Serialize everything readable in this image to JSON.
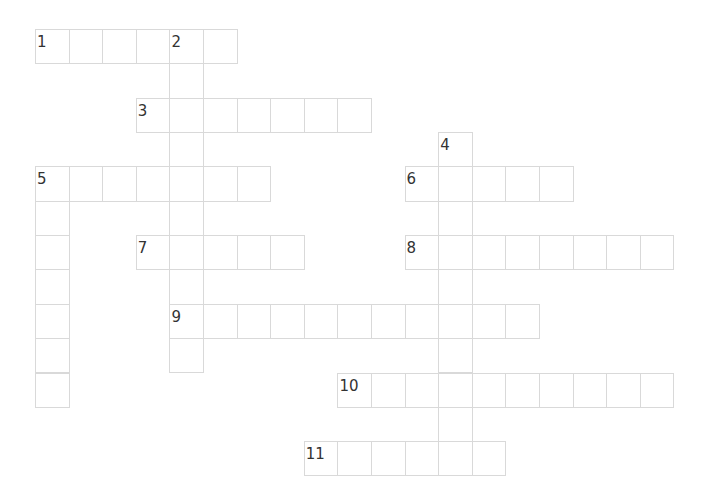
{
  "puzzle": {
    "grid": {
      "origin_x": 35,
      "origin_y": 29,
      "cell_w": 33.6,
      "cell_h": 34.35,
      "line_color": "#d9d9d9"
    },
    "words": [
      {
        "number": "1",
        "direction": "across",
        "row": 0,
        "col": 0,
        "length": 6
      },
      {
        "number": "2",
        "direction": "down",
        "row": 0,
        "col": 4,
        "length": 10
      },
      {
        "number": "3",
        "direction": "across",
        "row": 2,
        "col": 3,
        "length": 7
      },
      {
        "number": "4",
        "direction": "down",
        "row": 3,
        "col": 12,
        "length": 10
      },
      {
        "number": "5",
        "direction": "across",
        "row": 4,
        "col": 0,
        "length": 7
      },
      {
        "number": "5",
        "direction": "down",
        "row": 4,
        "col": 0,
        "length": 7
      },
      {
        "number": "6",
        "direction": "across",
        "row": 4,
        "col": 11,
        "length": 5
      },
      {
        "number": "7",
        "direction": "across",
        "row": 6,
        "col": 3,
        "length": 5
      },
      {
        "number": "8",
        "direction": "across",
        "row": 6,
        "col": 11,
        "length": 8
      },
      {
        "number": "9",
        "direction": "across",
        "row": 8,
        "col": 4,
        "length": 11
      },
      {
        "number": "10",
        "direction": "across",
        "row": 10,
        "col": 9,
        "length": 10
      },
      {
        "number": "11",
        "direction": "across",
        "row": 12,
        "col": 8,
        "length": 6
      }
    ]
  }
}
